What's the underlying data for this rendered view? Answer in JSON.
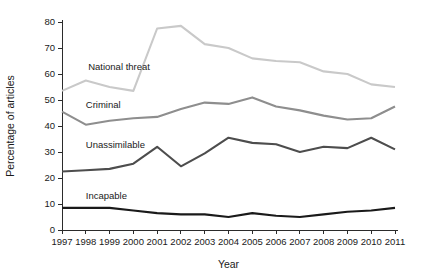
{
  "chart_data": {
    "type": "line",
    "title": "",
    "xlabel": "Year",
    "ylabel": "Percentage of articles",
    "x": [
      1997,
      1998,
      1999,
      2000,
      2001,
      2002,
      2003,
      2004,
      2005,
      2006,
      2007,
      2008,
      2009,
      2010,
      2011
    ],
    "categories": [
      "1997",
      "1998",
      "1999",
      "2000",
      "2001",
      "2002",
      "2003",
      "2004",
      "2005",
      "2006",
      "2007",
      "2008",
      "2009",
      "2010",
      "2011"
    ],
    "xlim": [
      1997,
      2011
    ],
    "ylim": [
      0,
      80
    ],
    "yticks": [
      0,
      10,
      20,
      30,
      40,
      50,
      60,
      70,
      80
    ],
    "ytick_labels": [
      "0",
      "10",
      "20",
      "30",
      "40",
      "50",
      "60",
      "70",
      "80"
    ],
    "grid": false,
    "legend": "inline-labels",
    "series": [
      {
        "name": "National threat",
        "color": "#c9c9c9",
        "label_x": 1998.1,
        "label_y": 61.5,
        "values": [
          53.5,
          57.5,
          55.0,
          53.5,
          77.5,
          78.5,
          71.5,
          70.0,
          66.0,
          65.0,
          64.5,
          61.0,
          60.0,
          56.0,
          55.0
        ]
      },
      {
        "name": "Criminal",
        "color": "#8e8e8e",
        "label_x": 1998.0,
        "label_y": 47.0,
        "values": [
          45.5,
          40.5,
          42.0,
          43.0,
          43.5,
          46.5,
          49.0,
          48.5,
          51.0,
          47.5,
          46.0,
          44.0,
          42.5,
          43.0,
          47.5
        ]
      },
      {
        "name": "Unassimilable",
        "color": "#4d4d4d",
        "label_x": 1998.0,
        "label_y": 31.5,
        "values": [
          22.5,
          23.0,
          23.5,
          25.5,
          32.0,
          24.5,
          29.5,
          35.5,
          33.5,
          33.0,
          30.0,
          32.0,
          31.5,
          35.5,
          31.0
        ]
      },
      {
        "name": "Incapable",
        "color": "#1a1a1a",
        "label_x": 1998.0,
        "label_y": 12.0,
        "values": [
          8.5,
          8.5,
          8.5,
          7.5,
          6.5,
          6.0,
          6.0,
          5.0,
          6.5,
          5.5,
          5.0,
          6.0,
          7.0,
          7.5,
          8.5
        ]
      }
    ]
  }
}
